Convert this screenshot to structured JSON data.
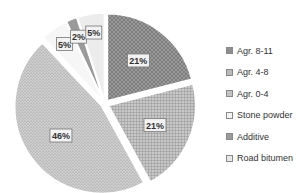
{
  "chart_data": {
    "type": "pie",
    "title": "",
    "categories": [
      "Agr. 8-11",
      "Agr. 4-8",
      "Agr. 0-4",
      "Stone powder",
      "Additive",
      "Road bitumen"
    ],
    "values": [
      21,
      21,
      46,
      5,
      2,
      5
    ],
    "labels": [
      "21%",
      "21%",
      "46%",
      "5%",
      "2%",
      "5%"
    ],
    "unit": "%",
    "legend_position": "right",
    "colors": [
      "#8e8e8e",
      "#b9b9b9",
      "#c4c4c4",
      "#f4f4f4",
      "#9a9a9a",
      "#e8e8e8"
    ]
  },
  "legend": {
    "items": [
      {
        "label": "Agr. 8-11"
      },
      {
        "label": "Agr. 4-8"
      },
      {
        "label": "Agr. 0-4"
      },
      {
        "label": "Stone powder"
      },
      {
        "label": "Additive"
      },
      {
        "label": "Road bitumen"
      }
    ]
  }
}
